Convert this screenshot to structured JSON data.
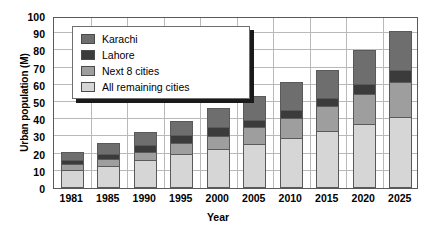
{
  "chart_data": {
    "type": "bar",
    "stacked": true,
    "title": "",
    "xlabel": "Year",
    "ylabel": "Urban population (M)",
    "ylim": [
      0,
      100
    ],
    "ytick_step": 10,
    "yticks": [
      0,
      10,
      20,
      30,
      40,
      50,
      60,
      70,
      80,
      90,
      100
    ],
    "grid": true,
    "legend_position": "upper-left-inside",
    "categories": [
      "1981",
      "1985",
      "1990",
      "1995",
      "2000",
      "2005",
      "2010",
      "2015",
      "2020",
      "2025"
    ],
    "series": [
      {
        "name": "All remaining cities",
        "color": "#d6d6d6",
        "values": [
          10.5,
          13.0,
          16.0,
          19.5,
          22.5,
          25.5,
          29.0,
          33.0,
          37.0,
          41.0
        ]
      },
      {
        "name": "Next 8 cities",
        "color": "#9e9e9e",
        "values": [
          4.0,
          4.5,
          5.5,
          7.0,
          8.5,
          10.5,
          12.5,
          15.0,
          18.0,
          21.0
        ]
      },
      {
        "name": "Lahore",
        "color": "#3b3b3b",
        "values": [
          3.0,
          3.5,
          4.5,
          5.5,
          5.5,
          4.5,
          5.0,
          5.5,
          6.5,
          8.0
        ]
      },
      {
        "name": "Karachi",
        "color": "#6e6e6e",
        "values": [
          5.0,
          7.0,
          8.5,
          9.0,
          11.5,
          15.0,
          17.0,
          17.0,
          20.5,
          23.0
        ]
      }
    ],
    "totals": [
      22.5,
      28.0,
      34.5,
      41.0,
      48.0,
      55.5,
      63.5,
      70.5,
      82.0,
      93.0
    ],
    "legend_entries": [
      {
        "label": "Karachi",
        "color": "#6e6e6e"
      },
      {
        "label": "Lahore",
        "color": "#3b3b3b"
      },
      {
        "label": "Next 8 cities",
        "color": "#9e9e9e"
      },
      {
        "label": "All remaining cities",
        "color": "#d6d6d6"
      }
    ]
  },
  "axes": {
    "y_title": "Urban population (M)",
    "x_title": "Year"
  }
}
